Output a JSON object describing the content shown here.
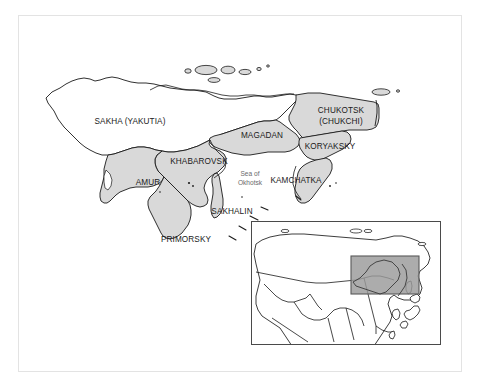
{
  "figure": {
    "kind": "map",
    "title_visible": false,
    "background_color": "#ffffff",
    "frame_border_color": "#e3e3e3"
  },
  "main_map": {
    "name": "russian-far-east-administrative-map",
    "land_fill": "#ffffff",
    "highlight_fill": "#d9d9d9",
    "outline_color": "#1a1a1a",
    "region_labels": [
      {
        "id": "sakha",
        "text": "SAKHA (YAKUTIA)",
        "x": 130,
        "y": 124,
        "shaded": false
      },
      {
        "id": "chukotsk",
        "text": "CHUKOTSK",
        "x": 341,
        "y": 113,
        "shaded": true
      },
      {
        "id": "chukchi",
        "text": "(CHUKCHI)",
        "x": 341,
        "y": 124,
        "shaded": true
      },
      {
        "id": "magadan",
        "text": "MAGADAN",
        "x": 262,
        "y": 138,
        "shaded": true
      },
      {
        "id": "koryaksky",
        "text": "KORYAKSKY",
        "x": 330,
        "y": 148,
        "shaded": true
      },
      {
        "id": "khabarovsk",
        "text": "KHABAROVSK",
        "x": 199,
        "y": 164,
        "shaded": true
      },
      {
        "id": "amur",
        "text": "AMUR",
        "x": 148,
        "y": 184,
        "shaded": true
      },
      {
        "id": "kamchatka",
        "text": "KAMCHATKA",
        "x": 296,
        "y": 182,
        "shaded": true
      },
      {
        "id": "sakhalin",
        "text": "SAKHALIN",
        "x": 232,
        "y": 213,
        "shaded": true
      },
      {
        "id": "primorsky",
        "text": "PRIMORSKY",
        "x": 186,
        "y": 241,
        "shaded": true
      }
    ],
    "water_labels": [
      {
        "id": "sea-of-okhotsk",
        "line1": "Sea of",
        "line2": "Okhotsk",
        "x": 250,
        "y": 176
      }
    ]
  },
  "inset_map": {
    "name": "eurasia-locator-inset",
    "frame_color": "#4a4a4a",
    "land_fill": "#ffffff",
    "outline_color": "#1a1a1a",
    "highlight_rect_fill": "#9a9a9a",
    "highlight_rect_border": "#5a5a5a",
    "labels": []
  }
}
